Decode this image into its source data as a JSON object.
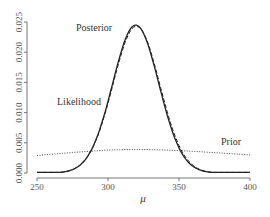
{
  "chart_data": {
    "type": "line",
    "title": "",
    "xlabel": "μ",
    "ylabel": "",
    "xlim": [
      250,
      400
    ],
    "ylim": [
      0,
      0.025
    ],
    "grid": false,
    "legend": "none (inline annotations)",
    "xticks": [
      "250",
      "300",
      "350",
      "400"
    ],
    "yticks": [
      "0.000",
      "0.005",
      "0.010",
      "0.015",
      "0.020",
      "0.025"
    ],
    "series": [
      {
        "name": "Posterior",
        "style": "solid",
        "color": "#222222",
        "x": [
          250,
          270,
          280,
          290,
          300,
          305,
          310,
          315,
          320,
          325,
          330,
          335,
          340,
          350,
          360,
          370,
          380,
          400
        ],
        "values": [
          0.0001,
          0.0008,
          0.0025,
          0.0066,
          0.0138,
          0.018,
          0.0215,
          0.0238,
          0.0245,
          0.0236,
          0.0212,
          0.0176,
          0.0134,
          0.0061,
          0.002,
          0.0005,
          0.0002,
          0.0001
        ]
      },
      {
        "name": "Likelihood",
        "style": "dashed",
        "color": "#222222",
        "x": [
          250,
          270,
          280,
          290,
          300,
          305,
          310,
          315,
          320,
          325,
          330,
          335,
          340,
          350,
          360,
          370,
          380,
          400
        ],
        "values": [
          0.0001,
          0.0008,
          0.0024,
          0.0064,
          0.0135,
          0.0177,
          0.0212,
          0.0236,
          0.0243,
          0.0235,
          0.0212,
          0.0177,
          0.0136,
          0.0063,
          0.0021,
          0.0006,
          0.0002,
          0.0001
        ]
      },
      {
        "name": "Prior",
        "style": "dotted",
        "color": "#444444",
        "x": [
          250,
          275,
          300,
          320,
          340,
          360,
          380,
          400
        ],
        "values": [
          0.0029,
          0.0034,
          0.0038,
          0.0039,
          0.0038,
          0.0036,
          0.0033,
          0.003
        ]
      }
    ],
    "annotations": [
      {
        "text": "Posterior",
        "x": 297,
        "y": 0.0235
      },
      {
        "text": "Likelihood",
        "x": 273,
        "y": 0.0118
      },
      {
        "text": "Prior",
        "x": 375,
        "y": 0.0045
      }
    ]
  },
  "labels": {
    "posterior": "Posterior",
    "likelihood": "Likelihood",
    "prior": "Prior",
    "xlabel": "μ"
  }
}
